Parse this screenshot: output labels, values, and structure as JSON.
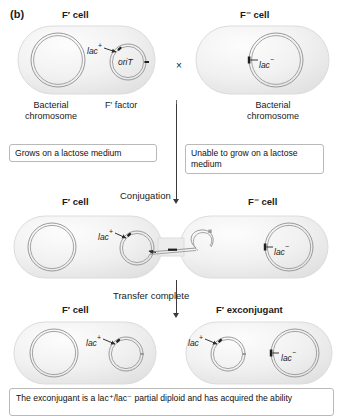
{
  "figure": {
    "panel_letter": "(b)",
    "caption": "The exconjugant is a lac⁺/lac⁻ partial diploid and has acquired the ability"
  },
  "row1": {
    "left_cell_title": "F′ cell",
    "right_cell_title": "F⁻ cell",
    "cross_symbol": "×",
    "left_labels": {
      "chromosome_line1": "Bacterial",
      "chromosome_line2": "chromosome",
      "factor": "F′ factor",
      "lac_plus": "lac",
      "lac_plus_sup": "+",
      "orit": "oriT"
    },
    "right_labels": {
      "chromosome_line1": "Bacterial",
      "chromosome_line2": "chromosome",
      "lac_minus": "lac",
      "lac_minus_sup": "−"
    },
    "left_note": "Grows on a lactose medium",
    "right_note": "Unable to grow on a lactose medium"
  },
  "step1": {
    "arrow_label": "Conjugation"
  },
  "row2": {
    "left_cell_title": "F′ cell",
    "right_cell_title": "F⁻ cell",
    "lac_plus": "lac",
    "lac_plus_sup": "+",
    "lac_minus": "lac",
    "lac_minus_sup": "−"
  },
  "step2": {
    "arrow_label": "Transfer complete"
  },
  "row3": {
    "left_cell_title": "F′ cell",
    "right_cell_title": "F′ exconjugant",
    "left_lac_plus": "lac",
    "left_lac_plus_sup": "+",
    "right_lac_plus": "lac",
    "right_lac_plus_sup": "+",
    "right_lac_minus": "lac",
    "right_lac_minus_sup": "−"
  },
  "colors": {
    "cell_fill": "#f2f2f2",
    "cell_stroke": "#d4d4d4",
    "dna_stroke": "#8c8c8c",
    "text": "#1a1a1a",
    "box_border": "#b9b9b9",
    "arrow": "#3a3a3a"
  }
}
